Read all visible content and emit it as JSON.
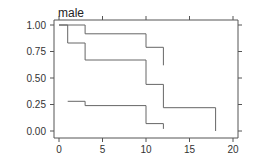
{
  "chart_data": {
    "type": "line",
    "subtype": "step (Kaplan-Meier)",
    "title": "male",
    "xlabel": "",
    "ylabel": "",
    "xlim": [
      0,
      20
    ],
    "ylim": [
      0,
      1
    ],
    "x_ticks": [
      "0",
      "5",
      "10",
      "15",
      "20"
    ],
    "y_ticks": [
      "0.00",
      "0.25",
      "0.50",
      "0.75",
      "1.00"
    ],
    "series": [
      {
        "name": "curve-1",
        "points": [
          [
            0,
            1.0
          ],
          [
            3,
            1.0
          ],
          [
            3,
            0.917
          ],
          [
            10,
            0.917
          ],
          [
            10,
            0.79
          ],
          [
            12,
            0.79
          ],
          [
            12,
            0.62
          ]
        ]
      },
      {
        "name": "curve-2",
        "points": [
          [
            0,
            1.0
          ],
          [
            1,
            1.0
          ],
          [
            1,
            0.83
          ],
          [
            3,
            0.83
          ],
          [
            3,
            0.67
          ],
          [
            10,
            0.67
          ],
          [
            10,
            0.44
          ],
          [
            12,
            0.44
          ],
          [
            12,
            0.22
          ],
          [
            18,
            0.22
          ],
          [
            18,
            0.0
          ]
        ]
      },
      {
        "name": "curve-3",
        "points": [
          [
            1,
            0.28
          ],
          [
            3,
            0.28
          ],
          [
            3,
            0.24
          ],
          [
            10,
            0.24
          ],
          [
            10,
            0.07
          ],
          [
            12,
            0.07
          ],
          [
            12,
            0.02
          ]
        ]
      }
    ]
  }
}
